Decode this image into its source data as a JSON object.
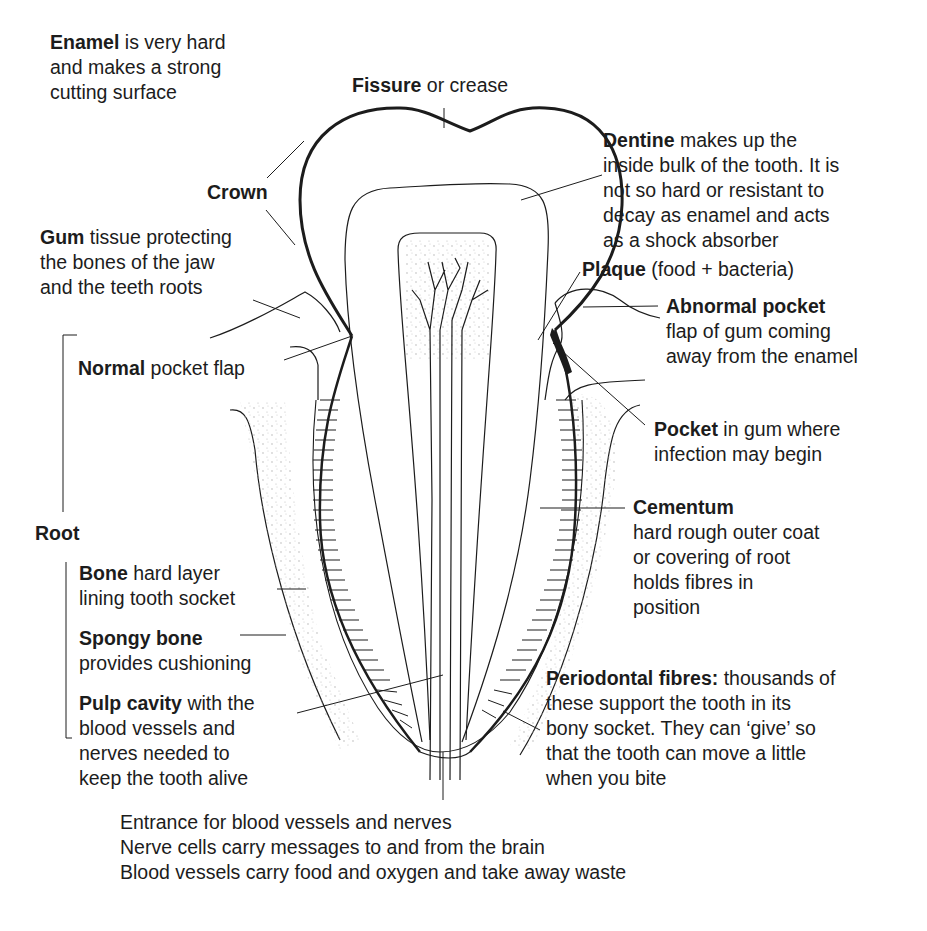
{
  "diagram": {
    "labels": {
      "enamel": {
        "bold": "Enamel",
        "rest": " is very hard",
        "lines": [
          "and makes a strong",
          "cutting surface"
        ]
      },
      "fissure": {
        "bold": "Fissure",
        "rest": " or crease"
      },
      "dentine": {
        "bold": "Dentine",
        "rest": " makes up the",
        "lines": [
          "inside bulk of the tooth. It is",
          "not so hard or resistant to",
          "decay as enamel and acts",
          "as a shock absorber"
        ]
      },
      "crown": {
        "bold": "Crown"
      },
      "gum": {
        "bold": "Gum",
        "rest": " tissue protecting",
        "lines": [
          "the bones of the jaw",
          "and the teeth roots"
        ]
      },
      "plaque": {
        "bold": "Plaque",
        "rest": " (food + bacteria)"
      },
      "abnormal_pocket": {
        "bold": "Abnormal pocket",
        "lines": [
          "flap of gum coming",
          "away from the enamel"
        ]
      },
      "normal_pocket": {
        "bold": "Normal",
        "rest": " pocket flap"
      },
      "pocket": {
        "bold": "Pocket",
        "rest": " in gum where",
        "lines": [
          "infection may begin"
        ]
      },
      "root": {
        "bold": "Root"
      },
      "cementum": {
        "bold": "Cementum",
        "lines": [
          "hard rough outer coat",
          "or covering of root",
          "holds fibres in",
          "position"
        ]
      },
      "bone": {
        "bold": "Bone",
        "rest": " hard layer",
        "lines": [
          "lining tooth socket"
        ]
      },
      "spongy_bone": {
        "bold": "Spongy bone",
        "lines": [
          "provides cushioning"
        ]
      },
      "pulp_cavity": {
        "bold": "Pulp cavity",
        "rest": " with the",
        "lines": [
          "blood vessels and",
          "nerves needed to",
          "keep the tooth alive"
        ]
      },
      "periodontal": {
        "bold": "Periodontal fibres:",
        "rest": " thousands of",
        "lines": [
          "these support the tooth in its",
          "bony socket. They can ‘give’ so",
          "that the tooth can move a little",
          "when you bite"
        ]
      },
      "entrance": {
        "lines": [
          "Entrance for blood vessels and nerves",
          "Nerve cells carry messages to and from the brain",
          "Blood vessels carry food and oxygen and take away waste"
        ]
      }
    },
    "colors": {
      "ink": "#1c1c1c",
      "background": "#ffffff",
      "stipple": "#b8b8b8"
    }
  }
}
